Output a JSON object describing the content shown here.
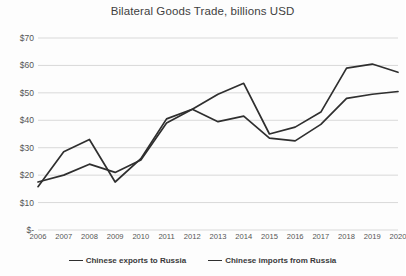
{
  "chart_data": {
    "type": "line",
    "title": "Bilateral Goods Trade, billions USD",
    "xlabel": "",
    "ylabel": "",
    "ylim": [
      0,
      70
    ],
    "grid": true,
    "legend_position": "bottom",
    "y_ticks": [
      "$-",
      "$10",
      "$20",
      "$30",
      "$40",
      "$50",
      "$60",
      "$70"
    ],
    "y_tick_values": [
      0,
      10,
      20,
      30,
      40,
      50,
      60,
      70
    ],
    "categories": [
      "2006",
      "2007",
      "2008",
      "2009",
      "2010",
      "2011",
      "2012",
      "2013",
      "2014",
      "2015",
      "2016",
      "2017",
      "2018",
      "2019",
      "2020"
    ],
    "series": [
      {
        "name": "Chinese exports to Russia",
        "color": "#2f2f2f",
        "values": [
          15.8,
          28.5,
          33.0,
          17.5,
          26.0,
          40.5,
          44.0,
          49.5,
          53.5,
          35.0,
          37.5,
          43.0,
          59.0,
          60.5,
          57.5
        ]
      },
      {
        "name": "Chinese imports from Russia",
        "color": "#2f2f2f",
        "values": [
          17.5,
          20.0,
          24.0,
          21.0,
          25.5,
          39.0,
          44.0,
          39.5,
          41.5,
          33.5,
          32.5,
          38.5,
          48.0,
          49.5,
          50.5
        ]
      }
    ]
  }
}
